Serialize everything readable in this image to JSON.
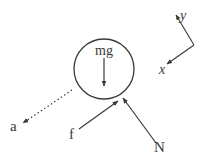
{
  "diagram": {
    "type": "free-body-diagram",
    "body": {
      "shape": "circle",
      "center": [
        104,
        69
      ],
      "radius": 30
    },
    "forces": [
      {
        "id": "mg",
        "label": "mg",
        "from": [
          104,
          58
        ],
        "to": [
          104,
          86
        ],
        "style": "solid"
      },
      {
        "id": "f",
        "label": "f",
        "from": [
          79,
          129
        ],
        "to": [
          118,
          101
        ],
        "style": "solid"
      },
      {
        "id": "N",
        "label": "N",
        "from": [
          156,
          143
        ],
        "to": [
          123,
          98
        ],
        "style": "solid"
      },
      {
        "id": "a",
        "label": "a",
        "from": [
          72,
          90
        ],
        "to": [
          23,
          123
        ],
        "style": "dotted"
      }
    ],
    "axes": {
      "origin": [
        194,
        45
      ],
      "y": {
        "label": "y",
        "to": [
          176,
          15
        ]
      },
      "x": {
        "label": "x",
        "to": [
          167,
          64
        ]
      }
    },
    "labels": {
      "mg": "mg",
      "f": "f",
      "N": "N",
      "a": "a",
      "x": "x",
      "y": "y"
    },
    "colors": {
      "stroke": "#3a3a3a",
      "background": "#ffffff"
    }
  }
}
